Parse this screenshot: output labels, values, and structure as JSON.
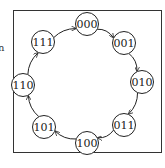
{
  "diagram": {
    "type": "state-cycle",
    "clipped_text": "n",
    "stroke_color": "#222222",
    "background": "#ffffff",
    "nodes": [
      {
        "id": "000",
        "label": "000",
        "x": 87,
        "y": 24
      },
      {
        "id": "001",
        "label": "001",
        "x": 124,
        "y": 43
      },
      {
        "id": "010",
        "label": "010",
        "x": 142,
        "y": 82
      },
      {
        "id": "011",
        "label": "011",
        "x": 124,
        "y": 125
      },
      {
        "id": "100",
        "label": "100",
        "x": 87,
        "y": 143
      },
      {
        "id": "101",
        "label": "101",
        "x": 44,
        "y": 127
      },
      {
        "id": "110",
        "label": "110",
        "x": 23,
        "y": 85
      },
      {
        "id": "111",
        "label": "111",
        "x": 43,
        "y": 42
      }
    ],
    "edges": [
      {
        "from": "000",
        "to": "001"
      },
      {
        "from": "001",
        "to": "010"
      },
      {
        "from": "010",
        "to": "011"
      },
      {
        "from": "011",
        "to": "100"
      },
      {
        "from": "100",
        "to": "101"
      },
      {
        "from": "101",
        "to": "110"
      },
      {
        "from": "110",
        "to": "111"
      },
      {
        "from": "111",
        "to": "000"
      }
    ]
  }
}
